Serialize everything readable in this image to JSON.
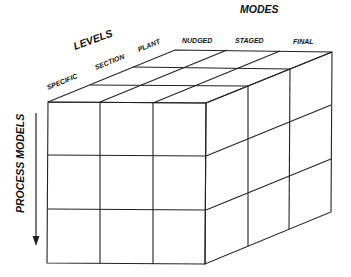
{
  "diagram": {
    "title_modes": "MODES",
    "title_levels": "LEVELS",
    "axis_process_models": "PROCESS MODELS",
    "levels": [
      "SPECIFIC",
      "SECTION",
      "PLANT"
    ],
    "modes": [
      "NUDGED",
      "STAGED",
      "FINAL"
    ],
    "grid": {
      "rows": 3,
      "cols": 3,
      "depth": 3
    },
    "colors": {
      "line": "#222222",
      "text": "#111111",
      "background": "#ffffff"
    }
  }
}
